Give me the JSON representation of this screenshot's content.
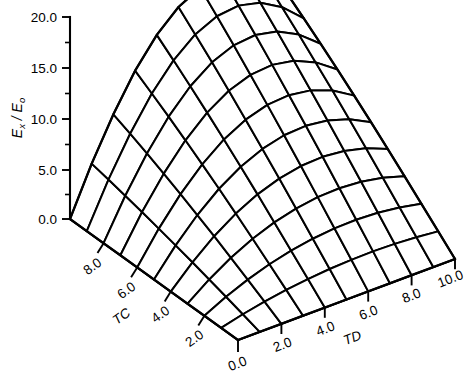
{
  "figure": {
    "kind": "3d-surface-mesh-plot",
    "background_color": "#ffffff",
    "line_color": "#000000"
  },
  "chart_data": {
    "type": "surface",
    "title": "",
    "xlabel": "TD",
    "ylabel": "TC",
    "zlabel": "Ex / Eo",
    "z_axis": {
      "label_main": "E",
      "label_sub1": "x",
      "label_slash": " / ",
      "label_main2": "E",
      "label_sub2": "o",
      "ticks": [
        "0.0",
        "5.0",
        "10.0",
        "15.0",
        "20.0"
      ],
      "tick_values": [
        0.0,
        5.0,
        10.0,
        15.0,
        20.0
      ],
      "minor_ticks_between": 1,
      "range": [
        0.0,
        20.0
      ]
    },
    "tc_axis": {
      "name": "TC",
      "ticks": [
        "2.0",
        "4.0",
        "6.0",
        "8.0"
      ],
      "tick_values": [
        2.0,
        4.0,
        6.0,
        8.0
      ],
      "range": [
        0.0,
        10.0
      ],
      "direction": "decreasing-toward-front-vertex"
    },
    "td_axis": {
      "name": "TD",
      "ticks": [
        "0.0",
        "2.0",
        "4.0",
        "6.0",
        "8.0",
        "10.0"
      ],
      "tick_values": [
        0.0,
        2.0,
        4.0,
        6.0,
        8.0,
        10.0
      ],
      "range": [
        0.0,
        10.0
      ],
      "direction": "increasing-toward-right"
    },
    "grid_divisions": {
      "td": 10,
      "tc": 10
    },
    "x": [
      0,
      1,
      2,
      3,
      4,
      5,
      6,
      7,
      8,
      9,
      10
    ],
    "y": [
      0,
      1,
      2,
      3,
      4,
      5,
      6,
      7,
      8,
      9,
      10
    ],
    "z": [
      [
        0.0,
        0.0,
        0.0,
        0.0,
        0.0,
        0.0,
        0.0,
        0.0,
        0.0,
        0.0,
        0.0
      ],
      [
        0.0,
        0.55,
        1.0,
        1.36,
        1.63,
        1.82,
        1.93,
        1.96,
        1.9,
        1.76,
        1.54
      ],
      [
        0.0,
        1.08,
        1.98,
        2.7,
        3.24,
        3.62,
        3.84,
        3.9,
        3.79,
        3.51,
        3.07
      ],
      [
        0.0,
        1.6,
        2.94,
        4.02,
        4.84,
        5.41,
        5.74,
        5.82,
        5.66,
        5.25,
        4.59
      ],
      [
        0.0,
        2.1,
        3.88,
        5.32,
        6.42,
        7.18,
        7.62,
        7.73,
        7.51,
        6.97,
        6.09
      ],
      [
        0.0,
        2.58,
        4.78,
        6.58,
        7.96,
        8.92,
        9.47,
        9.6,
        9.33,
        8.65,
        7.56
      ],
      [
        0.0,
        3.04,
        5.65,
        7.8,
        9.46,
        10.62,
        11.28,
        11.44,
        11.11,
        10.29,
        8.99
      ],
      [
        0.0,
        3.48,
        6.48,
        8.98,
        10.92,
        12.28,
        13.05,
        13.24,
        12.85,
        11.88,
        10.38
      ],
      [
        0.0,
        3.9,
        7.28,
        10.12,
        12.33,
        13.9,
        14.78,
        15.0,
        14.55,
        13.44,
        11.73
      ],
      [
        0.0,
        4.3,
        8.04,
        11.22,
        13.7,
        15.46,
        16.46,
        16.71,
        16.2,
        14.95,
        13.04
      ],
      [
        0.0,
        4.68,
        8.76,
        12.28,
        15.02,
        16.98,
        18.09,
        18.37,
        17.8,
        16.42,
        14.31
      ]
    ],
    "z_max": 18.37,
    "z_min": 0.0,
    "legend": "none",
    "grid": "mesh-wireframe"
  }
}
